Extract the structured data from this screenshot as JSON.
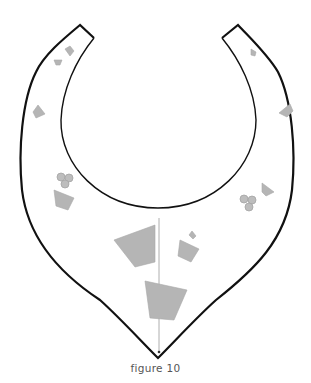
{
  "figure": {
    "caption": "figure 10",
    "colors": {
      "outline": "#111111",
      "shape_fill": "#b5b5b5",
      "centerline": "#9a9a9a",
      "background": "#ffffff"
    }
  }
}
